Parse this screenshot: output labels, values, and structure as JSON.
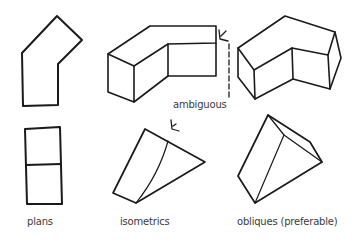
{
  "diagram": {
    "columns": [
      {
        "id": "plans",
        "label": "plans"
      },
      {
        "id": "isometrics",
        "label": "isometrics"
      },
      {
        "id": "obliques",
        "label": "obliques (preferable)"
      }
    ],
    "annotation": {
      "label": "ambiguous"
    },
    "colors": {
      "stroke": "#1a1a1a",
      "text": "#3a3a3a",
      "background": "#ffffff"
    }
  }
}
